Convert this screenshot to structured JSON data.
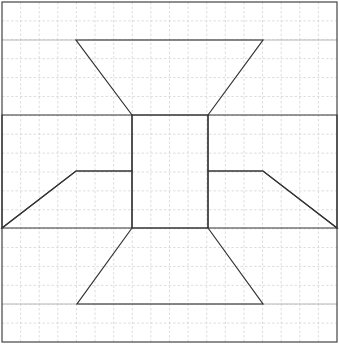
{
  "diagram": {
    "width": 339,
    "height": 348,
    "grid": {
      "origin": [
        2,
        2
      ],
      "cell": 18.83,
      "cols": 18,
      "rows": 18,
      "color": "#d4d4d4"
    },
    "border": {
      "x": 2,
      "y": 2,
      "w": 335,
      "h": 340,
      "color": "#444444"
    },
    "guide_lines": [
      {
        "name": "top-guide-line",
        "y": 40
      },
      {
        "name": "bottom-guide-line",
        "y": 304
      }
    ],
    "shapes": [
      {
        "name": "top-trapezoid",
        "points": [
          [
            76,
            40
          ],
          [
            263,
            40
          ],
          [
            208,
            115
          ],
          [
            132,
            115
          ]
        ]
      },
      {
        "name": "bottom-trapezoid",
        "points": [
          [
            132,
            228
          ],
          [
            208,
            228
          ],
          [
            263,
            304
          ],
          [
            77,
            304
          ]
        ]
      },
      {
        "name": "center-rectangle",
        "points": [
          [
            132,
            115
          ],
          [
            208,
            115
          ],
          [
            208,
            228
          ],
          [
            132,
            228
          ]
        ]
      },
      {
        "name": "left-arrow-shape",
        "points": [
          [
            2,
            115
          ],
          [
            132,
            115
          ],
          [
            132,
            171
          ],
          [
            76,
            171
          ],
          [
            2,
            228
          ]
        ]
      },
      {
        "name": "left-arrow-lower",
        "points": [
          [
            2,
            228
          ],
          [
            132,
            228
          ],
          [
            132,
            171
          ],
          [
            76,
            171
          ]
        ]
      },
      {
        "name": "right-arrow-shape",
        "points": [
          [
            337,
            115
          ],
          [
            208,
            115
          ],
          [
            208,
            171
          ],
          [
            263,
            171
          ],
          [
            337,
            228
          ]
        ]
      },
      {
        "name": "right-arrow-lower",
        "points": [
          [
            337,
            228
          ],
          [
            208,
            228
          ],
          [
            208,
            171
          ],
          [
            263,
            171
          ]
        ]
      }
    ],
    "stroke_color": "#333333"
  }
}
